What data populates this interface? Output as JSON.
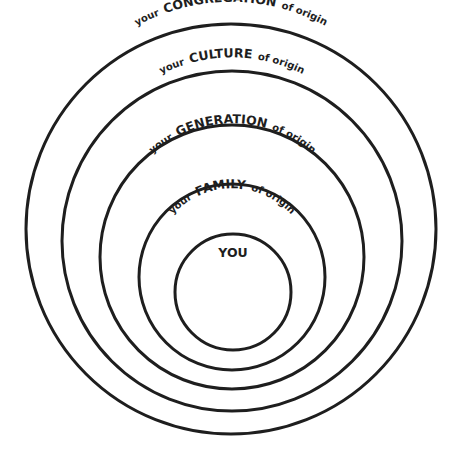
{
  "diagram": {
    "type": "concentric-circles",
    "rings": [
      {
        "id": "congregation",
        "prefix": "your",
        "keyword": "CONGREGATION",
        "suffix": "of origin"
      },
      {
        "id": "culture",
        "prefix": "your",
        "keyword": "CULTURE",
        "suffix": "of origin"
      },
      {
        "id": "generation",
        "prefix": "your",
        "keyword": "GENERATION",
        "suffix": "of origin"
      },
      {
        "id": "family",
        "prefix": "your",
        "keyword": "FAMILY",
        "suffix": "of origin"
      }
    ],
    "center": {
      "label": "YOU"
    },
    "stroke_color": "#1e1e1e"
  }
}
